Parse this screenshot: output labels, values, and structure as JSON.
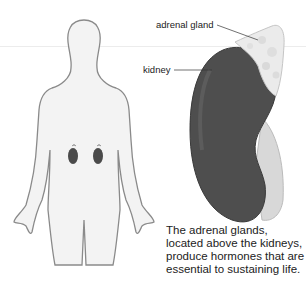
{
  "diagram": {
    "labels": {
      "adrenal_gland": "adrenal gland",
      "kidney": "kidney"
    },
    "caption": "The adrenal glands, located above the kidneys, produce hormones that are essential to sustaining life."
  }
}
